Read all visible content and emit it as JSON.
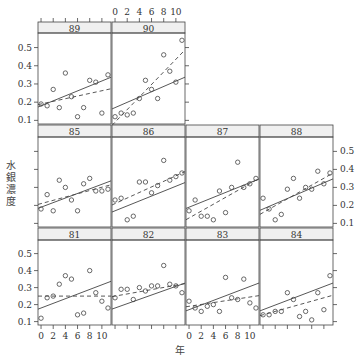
{
  "chart_data": {
    "type": "scatter",
    "title": "",
    "xlabel": "年",
    "ylabel": "水銀濃度",
    "xlim": [
      -0.5,
      11.5
    ],
    "ylim": [
      0.08,
      0.58
    ],
    "xticks": [
      0,
      2,
      4,
      6,
      8,
      10
    ],
    "yticks": [
      0.1,
      0.2,
      0.3,
      0.4,
      0.5
    ],
    "layout": {
      "rows": 3,
      "cols": 4
    },
    "legend": "none",
    "grid": false,
    "panels": [
      {
        "label": "89",
        "row": 0,
        "col": 0,
        "points": [
          [
            0,
            0.19
          ],
          [
            1,
            0.18
          ],
          [
            2,
            0.27
          ],
          [
            3,
            0.17
          ],
          [
            4,
            0.36
          ],
          [
            5,
            0.23
          ],
          [
            6,
            0.12
          ],
          [
            7,
            0.17
          ],
          [
            8,
            0.32
          ],
          [
            9,
            0.31
          ],
          [
            10,
            0.14
          ],
          [
            11,
            0.35
          ]
        ],
        "solid": [
          0.18,
          0.33
        ],
        "dashed": [
          0.19,
          0.27
        ]
      },
      {
        "label": "90",
        "row": 0,
        "col": 1,
        "points": [
          [
            0,
            0.12
          ],
          [
            1,
            0.14
          ],
          [
            2,
            0.13
          ],
          [
            3,
            0.14
          ],
          [
            4,
            0.22
          ],
          [
            5,
            0.32
          ],
          [
            6,
            0.27
          ],
          [
            7,
            0.22
          ],
          [
            8,
            0.46
          ],
          [
            9,
            0.37
          ],
          [
            10,
            0.31
          ],
          [
            11,
            0.54
          ]
        ],
        "solid": [
          0.17,
          0.33
        ],
        "dashed": [
          0.09,
          0.47
        ]
      },
      {
        "label": "85",
        "row": 1,
        "col": 0,
        "points": [
          [
            0,
            0.18
          ],
          [
            1,
            0.26
          ],
          [
            2,
            0.17
          ],
          [
            3,
            0.34
          ],
          [
            4,
            0.3
          ],
          [
            5,
            0.23
          ],
          [
            6,
            0.17
          ],
          [
            7,
            0.32
          ],
          [
            8,
            0.35
          ],
          [
            9,
            0.28
          ],
          [
            10,
            0.28
          ],
          [
            11,
            0.29
          ]
        ],
        "solid": [
          0.19,
          0.33
        ],
        "dashed": [
          0.21,
          0.31
        ]
      },
      {
        "label": "86",
        "row": 1,
        "col": 1,
        "points": [
          [
            0,
            0.23
          ],
          [
            1,
            0.24
          ],
          [
            2,
            0.12
          ],
          [
            3,
            0.14
          ],
          [
            4,
            0.33
          ],
          [
            5,
            0.33
          ],
          [
            6,
            0.27
          ],
          [
            7,
            0.31
          ],
          [
            8,
            0.45
          ],
          [
            9,
            0.34
          ],
          [
            10,
            0.36
          ],
          [
            11,
            0.38
          ]
        ],
        "solid": [
          0.17,
          0.32
        ],
        "dashed": [
          0.21,
          0.38
        ]
      },
      {
        "label": "87",
        "row": 1,
        "col": 2,
        "points": [
          [
            0,
            0.17
          ],
          [
            1,
            0.23
          ],
          [
            2,
            0.14
          ],
          [
            3,
            0.14
          ],
          [
            4,
            0.12
          ],
          [
            5,
            0.28
          ],
          [
            6,
            0.16
          ],
          [
            7,
            0.3
          ],
          [
            8,
            0.44
          ],
          [
            9,
            0.3
          ],
          [
            10,
            0.32
          ],
          [
            11,
            0.35
          ]
        ],
        "solid": [
          0.19,
          0.34
        ],
        "dashed": [
          0.13,
          0.34
        ]
      },
      {
        "label": "88",
        "row": 1,
        "col": 3,
        "points": [
          [
            0,
            0.24
          ],
          [
            1,
            0.18
          ],
          [
            2,
            0.12
          ],
          [
            3,
            0.15
          ],
          [
            4,
            0.29
          ],
          [
            5,
            0.35
          ],
          [
            6,
            0.24
          ],
          [
            7,
            0.3
          ],
          [
            8,
            0.29
          ],
          [
            9,
            0.39
          ],
          [
            10,
            0.32
          ],
          [
            11,
            0.38
          ]
        ],
        "solid": [
          0.18,
          0.34
        ],
        "dashed": [
          0.16,
          0.37
        ]
      },
      {
        "label": "81",
        "row": 2,
        "col": 0,
        "points": [
          [
            0,
            0.12
          ],
          [
            1,
            0.24
          ],
          [
            2,
            0.25
          ],
          [
            3,
            0.32
          ],
          [
            4,
            0.37
          ],
          [
            5,
            0.35
          ],
          [
            6,
            0.14
          ],
          [
            7,
            0.15
          ],
          [
            8,
            0.4
          ],
          [
            9,
            0.27
          ],
          [
            10,
            0.22
          ],
          [
            11,
            0.18
          ]
        ],
        "solid": [
          0.18,
          0.33
        ],
        "dashed": [
          0.25,
          0.25
        ]
      },
      {
        "label": "82",
        "row": 2,
        "col": 1,
        "points": [
          [
            0,
            0.24
          ],
          [
            1,
            0.29
          ],
          [
            2,
            0.29
          ],
          [
            3,
            0.23
          ],
          [
            4,
            0.3
          ],
          [
            5,
            0.28
          ],
          [
            6,
            0.31
          ],
          [
            7,
            0.31
          ],
          [
            8,
            0.43
          ],
          [
            9,
            0.32
          ],
          [
            10,
            0.31
          ],
          [
            11,
            0.27
          ]
        ],
        "solid": [
          0.18,
          0.32
        ],
        "dashed": [
          0.25,
          0.32
        ]
      },
      {
        "label": "83",
        "row": 2,
        "col": 2,
        "points": [
          [
            0,
            0.22
          ],
          [
            1,
            0.18
          ],
          [
            2,
            0.16
          ],
          [
            3,
            0.19
          ],
          [
            4,
            0.2
          ],
          [
            5,
            0.16
          ],
          [
            6,
            0.36
          ],
          [
            7,
            0.24
          ],
          [
            8,
            0.23
          ],
          [
            9,
            0.35
          ],
          [
            10,
            0.21
          ],
          [
            11,
            0.18
          ]
        ],
        "solid": [
          0.17,
          0.32
        ],
        "dashed": [
          0.19,
          0.25
        ]
      },
      {
        "label": "84",
        "row": 2,
        "col": 3,
        "points": [
          [
            0,
            0.14
          ],
          [
            1,
            0.14
          ],
          [
            2,
            0.16
          ],
          [
            3,
            0.16
          ],
          [
            4,
            0.27
          ],
          [
            5,
            0.23
          ],
          [
            6,
            0.13
          ],
          [
            7,
            0.16
          ],
          [
            8,
            0.11
          ],
          [
            9,
            0.27
          ],
          [
            10,
            0.17
          ],
          [
            11,
            0.37
          ]
        ],
        "solid": [
          0.17,
          0.32
        ],
        "dashed": [
          0.14,
          0.25
        ]
      }
    ]
  },
  "axes": {
    "ylabel_vertical": [
      "水",
      "銀",
      "濃",
      "度"
    ],
    "xlabel": "年"
  }
}
